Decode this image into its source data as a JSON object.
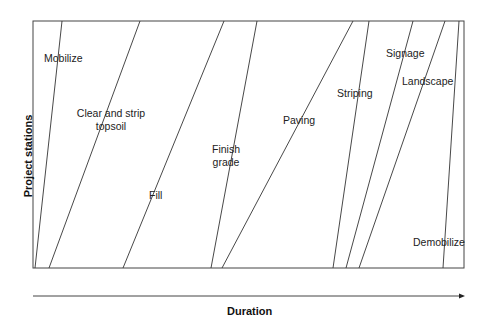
{
  "chart_data": {
    "type": "line",
    "title": "",
    "subtitle": "Linear scheduling (time-location) diagram",
    "xlabel": "Duration",
    "ylabel": "Project stations",
    "grid": false,
    "legend": "none (labels placed inline)",
    "x_range_px": [
      33,
      464
    ],
    "y_range_px": [
      268,
      21
    ],
    "activities": [
      {
        "name": "Mobilize",
        "bottom_x": 35,
        "top_x": 62
      },
      {
        "name": "Clear and strip topsoil",
        "bottom_x": 49,
        "top_x": 140
      },
      {
        "name": "Fill",
        "bottom_x": 123,
        "top_x": 224
      },
      {
        "name": "Finish grade",
        "bottom_x": 211,
        "top_x": 257
      },
      {
        "name": "Paving",
        "bottom_x": 222,
        "top_x": 353
      },
      {
        "name": "Striping",
        "bottom_x": 333,
        "top_x": 369
      },
      {
        "name": "Signage",
        "bottom_x": 346,
        "top_x": 413
      },
      {
        "name": "Landscape",
        "bottom_x": 359,
        "top_x": 445
      },
      {
        "name": "Demobilize",
        "bottom_x": 443,
        "top_x": 459
      }
    ]
  },
  "labels": {
    "mobilize": "Mobilize",
    "clear_line1": "Clear and strip",
    "clear_line2": "topsoil",
    "fill": "Fill",
    "finish_line1": "Finish",
    "finish_line2": "grade",
    "paving": "Paving",
    "striping": "Striping",
    "signage": "Signage",
    "landscape": "Landscape",
    "demobilize": "Demobilize"
  },
  "axes": {
    "x_title": "Duration",
    "y_title": "Project stations"
  }
}
